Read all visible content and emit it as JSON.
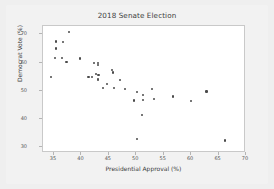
{
  "chart_data": {
    "type": "scatter",
    "title": "2018 Senate Election",
    "xlabel": "Presidential Approval (%)",
    "ylabel": "Democrat Vote (%)",
    "xlim": [
      33,
      70
    ],
    "ylim": [
      28,
      73
    ],
    "xticks": [
      35,
      40,
      45,
      50,
      55,
      60,
      65,
      70
    ],
    "yticks": [
      70,
      60,
      50,
      40,
      30
    ],
    "grid": false,
    "legend": null,
    "marker": "dot",
    "marker_color": "#4a4a4a",
    "points": [
      {
        "x": 37.7,
        "y": 71.0
      },
      {
        "x": 35.3,
        "y": 67.5
      },
      {
        "x": 36.6,
        "y": 67.4
      },
      {
        "x": 35.3,
        "y": 65.0
      },
      {
        "x": 35.2,
        "y": 61.8
      },
      {
        "x": 36.5,
        "y": 61.7
      },
      {
        "x": 39.8,
        "y": 61.5
      },
      {
        "x": 37.3,
        "y": 60.2
      },
      {
        "x": 42.3,
        "y": 59.8
      },
      {
        "x": 43.0,
        "y": 59.9
      },
      {
        "x": 43.0,
        "y": 59.1
      },
      {
        "x": 45.6,
        "y": 57.3
      },
      {
        "x": 45.7,
        "y": 56.5
      },
      {
        "x": 42.6,
        "y": 56.0
      },
      {
        "x": 43.1,
        "y": 55.6
      },
      {
        "x": 41.3,
        "y": 55.0
      },
      {
        "x": 42.0,
        "y": 55.0
      },
      {
        "x": 34.5,
        "y": 54.8
      },
      {
        "x": 43.0,
        "y": 54.3
      },
      {
        "x": 43.0,
        "y": 53.8
      },
      {
        "x": 47.0,
        "y": 54.0
      },
      {
        "x": 44.6,
        "y": 52.5
      },
      {
        "x": 44.0,
        "y": 51.0
      },
      {
        "x": 46.0,
        "y": 50.9
      },
      {
        "x": 47.9,
        "y": 50.6
      },
      {
        "x": 52.8,
        "y": 50.8
      },
      {
        "x": 50.2,
        "y": 49.6
      },
      {
        "x": 62.8,
        "y": 49.8
      },
      {
        "x": 51.2,
        "y": 48.6
      },
      {
        "x": 56.7,
        "y": 48.0
      },
      {
        "x": 53.2,
        "y": 47.0
      },
      {
        "x": 51.3,
        "y": 46.9
      },
      {
        "x": 49.6,
        "y": 46.6
      },
      {
        "x": 60.0,
        "y": 46.3
      },
      {
        "x": 51.0,
        "y": 41.5
      },
      {
        "x": 50.1,
        "y": 33.0
      },
      {
        "x": 66.2,
        "y": 32.4
      }
    ]
  }
}
